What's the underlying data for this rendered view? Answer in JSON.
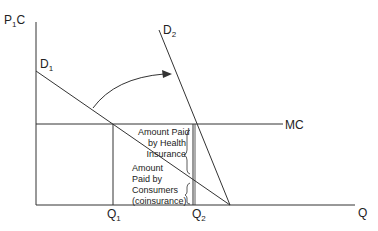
{
  "diagram": {
    "type": "economics-supply-demand",
    "axes": {
      "y_label_main": "P",
      "y_label_sub": "1",
      "y_label_tail": "C",
      "x_label": "Q"
    },
    "curves": {
      "d1": {
        "main": "D",
        "sub": "1"
      },
      "d2": {
        "main": "D",
        "sub": "2"
      },
      "mc": "MC"
    },
    "quantities": {
      "q1": {
        "main": "Q",
        "sub": "1"
      },
      "q2": {
        "main": "Q",
        "sub": "2"
      }
    },
    "annotations": {
      "insurance": [
        "Amount Paid",
        "by Health",
        "Insurance"
      ],
      "consumers": [
        "Amount",
        "Paid by",
        "Consumers",
        "(coinsurance)"
      ]
    },
    "colors": {
      "line": "#333333",
      "background": "#ffffff"
    }
  }
}
